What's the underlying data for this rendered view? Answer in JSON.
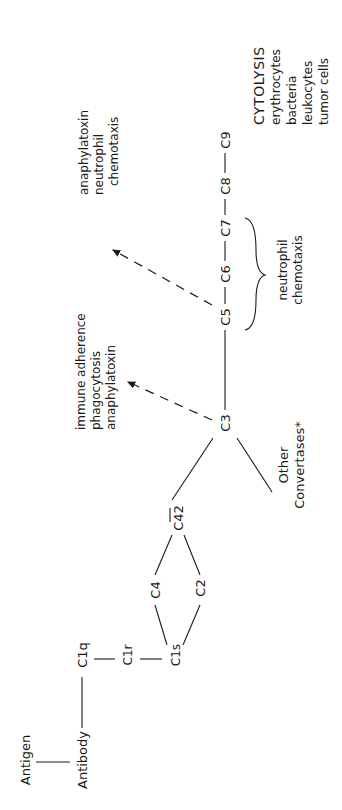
{
  "diagram": {
    "orientation": "rotated 90 degrees counter-clockwise",
    "nodes": {
      "antigen": "Antigen",
      "antibody": "Antibody",
      "c1q": "C1q",
      "c1r": "C1r",
      "c1s": "C1s",
      "c4": "C4",
      "c2": "C2",
      "c42": "C42",
      "c3": "C3",
      "c5": "C5",
      "c6": "C6",
      "c7": "C7",
      "c8": "C8",
      "c9": "C9",
      "other_line1": "Other",
      "other_line2": "Convertases*"
    },
    "c3_effects": [
      "immune adherence",
      "phagocytosis",
      "anaphylatoxin"
    ],
    "c5_effects": [
      "anaphylatoxin",
      "neutrophil",
      "chemotaxis"
    ],
    "c567_effect": [
      "neutrophil",
      "chemotaxis"
    ],
    "cytolysis": {
      "heading": "CYTOLYSIS",
      "targets": [
        "erythrocytes",
        "bacteria",
        "leukocytes",
        "tumor cells"
      ]
    },
    "edges": [
      [
        "Antigen",
        "Antibody"
      ],
      [
        "Antibody",
        "C1q"
      ],
      [
        "C1q",
        "C1r"
      ],
      [
        "C1r",
        "C1s"
      ],
      [
        "C1s",
        "C4"
      ],
      [
        "C1s",
        "C2"
      ],
      [
        "C4",
        "C42"
      ],
      [
        "C2",
        "C42"
      ],
      [
        "C42",
        "C3"
      ],
      [
        "Other Convertases*",
        "C3"
      ],
      [
        "C3",
        "C5"
      ],
      [
        "C5",
        "C6"
      ],
      [
        "C6",
        "C7"
      ],
      [
        "C7",
        "C8"
      ],
      [
        "C8",
        "C9"
      ]
    ],
    "dashed_arrows": [
      [
        "C3",
        "immune adherence / phagocytosis / anaphylatoxin"
      ],
      [
        "C5",
        "anaphylatoxin / neutrophil chemotaxis"
      ]
    ]
  }
}
